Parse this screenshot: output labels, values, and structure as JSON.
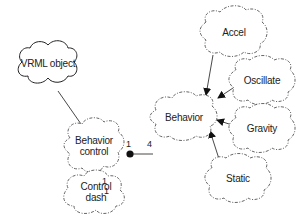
{
  "diagram": {
    "nodes": [
      {
        "id": "vrml_object",
        "label": "VRML object",
        "style": "solid-cloud"
      },
      {
        "id": "behavior_control",
        "label": "Behavior\ncontrol",
        "line1": "Behavior",
        "line2": "control",
        "style": "dashed-cloud"
      },
      {
        "id": "control_dash",
        "label": "Control\ndash",
        "line1": "Control",
        "line2": "dash",
        "style": "dashed-cloud"
      },
      {
        "id": "behavior",
        "label": "Behavior",
        "style": "dashed-cloud"
      },
      {
        "id": "accel",
        "label": "Accel",
        "style": "dashed-cloud"
      },
      {
        "id": "oscillate",
        "label": "Oscillate",
        "style": "dashed-cloud"
      },
      {
        "id": "gravity",
        "label": "Gravity",
        "style": "dashed-cloud"
      },
      {
        "id": "static",
        "label": "Static",
        "style": "dashed-cloud"
      }
    ],
    "edges": [
      {
        "from": "vrml_object",
        "to": "behavior_control",
        "type": "association"
      },
      {
        "from": "behavior_control",
        "to": "behavior",
        "type": "has",
        "from_mult": "1",
        "to_mult": "4"
      },
      {
        "from": "behavior_control",
        "to": "control_dash",
        "type": "has",
        "from_mult": "1",
        "to_mult": "1"
      },
      {
        "from": "accel",
        "to": "behavior",
        "type": "inherits"
      },
      {
        "from": "oscillate",
        "to": "behavior",
        "type": "inherits"
      },
      {
        "from": "gravity",
        "to": "behavior",
        "type": "inherits"
      },
      {
        "from": "static",
        "to": "behavior",
        "type": "inherits"
      }
    ],
    "multiplicities": {
      "bc_behavior_from": "1",
      "bc_behavior_to": "4",
      "bc_dash_from": "1",
      "bc_dash_to": "1"
    }
  }
}
